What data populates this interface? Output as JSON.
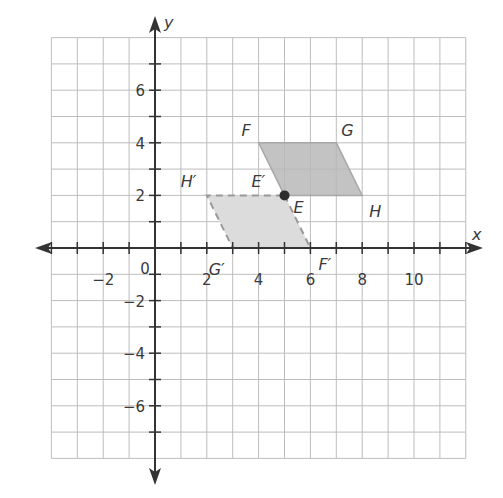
{
  "diagram": {
    "type": "coordinate-plane-translation",
    "axes": {
      "x_label": "x",
      "y_label": "y",
      "x_range": [
        -4,
        12
      ],
      "y_range": [
        -8,
        8
      ],
      "grid_step": 1,
      "x_tick_labels": [
        {
          "value": -2,
          "text": "−2"
        },
        {
          "value": 2,
          "text": "2"
        },
        {
          "value": 4,
          "text": "4"
        },
        {
          "value": 6,
          "text": "6"
        },
        {
          "value": 8,
          "text": "8"
        },
        {
          "value": 10,
          "text": "10"
        }
      ],
      "y_tick_labels": [
        {
          "value": 6,
          "text": "6"
        },
        {
          "value": 4,
          "text": "4"
        },
        {
          "value": 2,
          "text": "2"
        },
        {
          "value": -2,
          "text": "−2"
        },
        {
          "value": -4,
          "text": "−4"
        },
        {
          "value": -6,
          "text": "−6"
        }
      ],
      "origin_label": "0"
    },
    "original_figure": {
      "name": "FGHE",
      "style": "solid",
      "fill": "#b8b8b8",
      "vertices": [
        {
          "label": "F",
          "x": 4,
          "y": 4
        },
        {
          "label": "G",
          "x": 7,
          "y": 4
        },
        {
          "label": "H",
          "x": 8,
          "y": 2
        },
        {
          "label": "E",
          "x": 5,
          "y": 2
        }
      ]
    },
    "image_figure": {
      "name": "E'F'G'H'",
      "style": "dashed",
      "fill": "#dcdcdc",
      "vertices": [
        {
          "label": "E′",
          "x": 5,
          "y": 2
        },
        {
          "label": "F′",
          "x": 6,
          "y": 0
        },
        {
          "label": "G′",
          "x": 3,
          "y": 0
        },
        {
          "label": "H′",
          "x": 2,
          "y": 2
        }
      ]
    },
    "highlighted_point": {
      "label": "E / E′",
      "x": 5,
      "y": 2
    },
    "colors": {
      "grid": "#bdbdbd",
      "axis": "#333333",
      "text": "#3a3a3a",
      "original_fill": "#b8b8b8",
      "image_fill": "#dcdcdc",
      "image_stroke": "#9a9a9a"
    }
  }
}
